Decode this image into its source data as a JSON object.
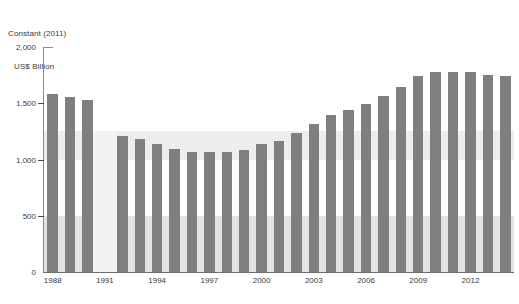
{
  "axis_title": {
    "line1": "Constant (2011)",
    "line2": "US$ Billion"
  },
  "chart_data": {
    "type": "bar",
    "title": "",
    "subtitle": "",
    "xlabel": "",
    "ylabel": "Constant (2011) US$ Billion",
    "ylim": [
      0,
      2000
    ],
    "ytick_labels": [
      "0",
      "500",
      "1,000",
      "1,500",
      "2,000"
    ],
    "ytick_values": [
      0,
      500,
      1000,
      1500,
      2000
    ],
    "xtick_labels": [
      "1988",
      "1991",
      "1994",
      "1997",
      "2000",
      "2003",
      "2006",
      "2009",
      "2012"
    ],
    "xtick_values": [
      1988,
      1991,
      1994,
      1997,
      2000,
      2003,
      2006,
      2009,
      2012
    ],
    "grid": false,
    "legend": "none",
    "bar_color": "#7f7f7f",
    "band_color_low": "#e3e3e3",
    "band_color_high": "#ededed",
    "missing_block_color": "#f2f2f2",
    "shaded_bands": [
      {
        "from": 0,
        "to": 500
      },
      {
        "from": 1000,
        "to": 1250
      }
    ],
    "categories": [
      "1988",
      "1989",
      "1990",
      "1991",
      "1992",
      "1993",
      "1994",
      "1995",
      "1996",
      "1997",
      "1998",
      "1999",
      "2000",
      "2001",
      "2002",
      "2003",
      "2004",
      "2005",
      "2006",
      "2007",
      "2008",
      "2009",
      "2010",
      "2011",
      "2012",
      "2013",
      "2014"
    ],
    "values": [
      1578,
      1552,
      1530,
      null,
      1212,
      1181,
      1140,
      1092,
      1063,
      1070,
      1063,
      1086,
      1136,
      1163,
      1233,
      1316,
      1392,
      1444,
      1491,
      1562,
      1648,
      1745,
      1779,
      1781,
      1776,
      1747,
      1740
    ],
    "missing_categories": [
      "1991"
    ]
  }
}
